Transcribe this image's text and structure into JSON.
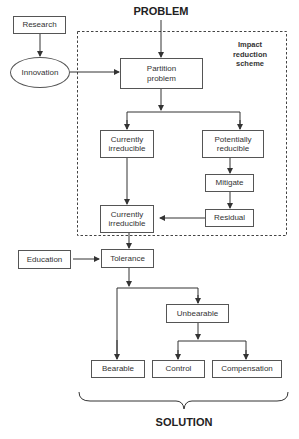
{
  "diagram": {
    "top_label": "PROBLEM",
    "bottom_label": "SOLUTION",
    "scheme_label": "Impact reduction scheme",
    "nodes": {
      "research": "Research",
      "innovation": "Innovation",
      "partition": "Partition problem",
      "currently_irreducible_1": "Currently irreducible",
      "potentially_reducible": "Potentially reducible",
      "mitigate": "Mitigate",
      "residual": "Residual",
      "currently_irreducible_2": "Currently irreducible",
      "education": "Education",
      "tolerance": "Tolerance",
      "unbearable": "Unbearable",
      "bearable": "Bearable",
      "control": "Control",
      "compensation": "Compensation"
    },
    "edges": [
      [
        "PROBLEM",
        "Partition problem"
      ],
      [
        "Research",
        "Innovation"
      ],
      [
        "Innovation",
        "Partition problem"
      ],
      [
        "Partition problem",
        "Currently irreducible"
      ],
      [
        "Partition problem",
        "Potentially reducible"
      ],
      [
        "Potentially reducible",
        "Mitigate"
      ],
      [
        "Mitigate",
        "Residual"
      ],
      [
        "Residual",
        "Currently irreducible (2)"
      ],
      [
        "Currently irreducible",
        "Currently irreducible (2)"
      ],
      [
        "Currently irreducible (2)",
        "Tolerance"
      ],
      [
        "Education",
        "Tolerance"
      ],
      [
        "Tolerance",
        "Bearable"
      ],
      [
        "Tolerance",
        "Unbearable"
      ],
      [
        "Unbearable",
        "Control"
      ],
      [
        "Unbearable",
        "Compensation"
      ]
    ]
  }
}
